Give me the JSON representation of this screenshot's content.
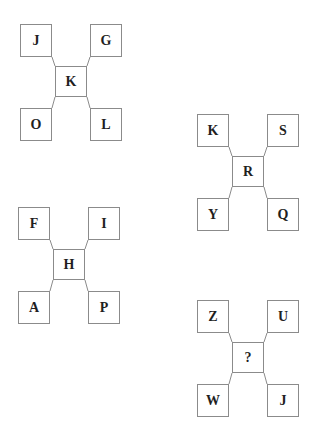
{
  "page": {
    "background_color": "#ffffff",
    "box_border_color": "#8b8b8b",
    "letter_color": "#1f1f1f"
  },
  "clusters": [
    {
      "tl": "J",
      "tr": "G",
      "c": "K",
      "bl": "O",
      "br": "L"
    },
    {
      "tl": "K",
      "tr": "S",
      "c": "R",
      "bl": "Y",
      "br": "Q"
    },
    {
      "tl": "F",
      "tr": "I",
      "c": "H",
      "bl": "A",
      "br": "P"
    },
    {
      "tl": "Z",
      "tr": "U",
      "c": "?",
      "bl": "W",
      "br": "J"
    }
  ]
}
